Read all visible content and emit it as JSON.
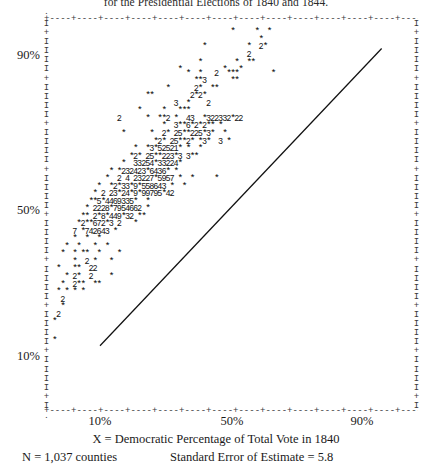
{
  "chart_data": {
    "type": "scatter",
    "title": "for the Presidential Elections of 1840 and 1844.",
    "xlabel": "X = Democratic Percentage of Total Vote in 1840",
    "ylabel": "",
    "xlim": [
      0,
      100
    ],
    "ylim": [
      0,
      100
    ],
    "grid": false,
    "legend": "none",
    "xticks": [
      "10%",
      "50%",
      "90%"
    ],
    "xtick_values": [
      10,
      50,
      90
    ],
    "yticks": [
      "90%",
      "50%",
      "10%"
    ],
    "ytick_values": [
      90,
      50,
      10
    ],
    "point_marker": "*",
    "overplot_notation": "digits 2-9 indicate number of coincident counties",
    "n_label": "N = 1,037 counties",
    "n_value": 1037,
    "se_label": "Standard Error of Estimate = 5.8",
    "se_value": 5.8,
    "regression_line": {
      "x_start": 10,
      "y_start": 13,
      "x_end": 96,
      "y_end": 92
    },
    "rows": [
      {
        "y": 96,
        "cells": "                                             *     *  *"
      },
      {
        "y": 94,
        "cells": "                                                    *"
      },
      {
        "y": 92,
        "cells": "                                      *          *  2*"
      },
      {
        "y": 90,
        "cells": "                                                 2"
      },
      {
        "y": 88,
        "cells": "                                     *        *  **"
      },
      {
        "y": 86,
        "cells": "                                *          *   *"
      },
      {
        "y": 85,
        "cells": "                                  *  *   2  ***        *"
      },
      {
        "y": 83,
        "cells": "                                    **3      **"
      },
      {
        "y": 81,
        "cells": "                             *      2*  **"
      },
      {
        "y": 79,
        "cells": "                        **         2*2*"
      },
      {
        "y": 77,
        "cells": "                               3  *    2"
      },
      {
        "y": 75,
        "cells": "                      *     *   ***"
      },
      {
        "y": 73,
        "cells": "                 2      *  **2 *  43  *322332*22"
      },
      {
        "y": 71,
        "cells": "                            *  3**6*2*2** *"
      },
      {
        "y": 69,
        "cells": "                  *      *  2* 25**225*3*  *"
      },
      {
        "y": 67,
        "cells": "                          *2* 25**2* *3*  3 *"
      },
      {
        "y": 65,
        "cells": "                     *  *3*52521* *  *"
      },
      {
        "y": 63,
        "cells": "                    *2* 25**223*3 3**"
      },
      {
        "y": 61,
        "cells": "                  *  33254*33224*"
      },
      {
        "y": 59,
        "cells": "               * *232423*6436* *"
      },
      {
        "y": 57,
        "cells": "              *  2 4 23227*5957 *  *     *"
      },
      {
        "y": 55,
        "cells": "            *  *2*33*9*558643 *  *"
      },
      {
        "y": 53,
        "cells": "           * 2 23*24*9*99795*42"
      },
      {
        "y": 51,
        "cells": "          **5*4469335*  *"
      },
      {
        "y": 49,
        "cells": "         * 2228*7954662 *"
      },
      {
        "y": 47,
        "cells": "        ** 2*8*449*32 **"
      },
      {
        "y": 45,
        "cells": "       *2**672*3 2   *"
      },
      {
        "y": 43,
        "cells": "      7 *742643 *"
      },
      {
        "y": 41,
        "cells": "      *  *  *"
      },
      {
        "y": 39,
        "cells": "    *  *   *  *"
      },
      {
        "y": 37,
        "cells": "   *  * **  *    *"
      },
      {
        "y": 35,
        "cells": "      *  2 *   *"
      },
      {
        "y": 33,
        "cells": "  *   **  22"
      },
      {
        "y": 31,
        "cells": "    * 2*  2    *"
      },
      {
        "y": 29,
        "cells": "   *  2**  **"
      },
      {
        "y": 27,
        "cells": "  * * * *"
      },
      {
        "y": 25,
        "cells": "   2"
      },
      {
        "y": 23,
        "cells": "   *"
      },
      {
        "y": 21,
        "cells": "  2"
      },
      {
        "y": 19,
        "cells": " *"
      },
      {
        "y": 14,
        "cells": " *"
      }
    ]
  },
  "figure": {
    "title": "for the Presidential Elections of 1840 and 1844.",
    "xlabel": "X = Democratic Percentage of Total Vote in 1840",
    "n_text": "N = 1,037 counties",
    "se_text": "Standard Error of Estimate = 5.8",
    "ytick_labels": [
      "90%",
      "50%",
      "10%"
    ],
    "xtick_labels": [
      "10%",
      "50%",
      "90%"
    ],
    "frame_top": "+----+----+----+----+----+----+----+----+----+----+----+----+----+----+----+----+----+----+-",
    "frame_bottom": "+----+----+----+----+----+----+----+----+----+----+----+----+----+----+----+----+----+----+-",
    "frame_cap_top": ".                                                                                            .",
    "frame_cap_bottom": ".                                                                                            .",
    "frame_vertical_unit": "I",
    "frame_tick_unit": "+",
    "ink_color": "#1a1a1a",
    "paper_color": "#ffffff"
  },
  "points_detail": {
    "scatter_glyphs": [
      {
        "x": 83,
        "y": 96,
        "g": "*"
      },
      {
        "x": 90,
        "y": 96,
        "g": "*"
      },
      {
        "x": 94,
        "y": 96,
        "g": "*"
      },
      {
        "x": 90,
        "y": 94,
        "g": "*"
      },
      {
        "x": 70,
        "y": 92,
        "g": "*"
      },
      {
        "x": 86,
        "y": 92,
        "g": "*"
      },
      {
        "x": 90,
        "y": 92,
        "g": "2"
      },
      {
        "x": 92,
        "y": 92,
        "g": "*"
      },
      {
        "x": 86,
        "y": 90,
        "g": "2"
      },
      {
        "x": 66,
        "y": 88,
        "g": "*"
      },
      {
        "x": 84,
        "y": 88,
        "g": "*"
      },
      {
        "x": 89,
        "y": 88,
        "g": "*"
      },
      {
        "x": 91,
        "y": 88,
        "g": "*"
      },
      {
        "x": 56,
        "y": 86,
        "g": "*"
      },
      {
        "x": 78,
        "y": 86,
        "g": "*"
      },
      {
        "x": 88,
        "y": 86,
        "g": "*"
      },
      {
        "x": 60,
        "y": 85,
        "g": "*"
      },
      {
        "x": 66,
        "y": 85,
        "g": "*"
      },
      {
        "x": 72,
        "y": 85,
        "g": "2"
      },
      {
        "x": 79,
        "y": 85,
        "g": "*"
      },
      {
        "x": 81,
        "y": 85,
        "g": "*"
      },
      {
        "x": 83,
        "y": 85,
        "g": "*"
      },
      {
        "x": 93,
        "y": 85,
        "g": "*"
      },
      {
        "x": 64,
        "y": 83,
        "g": "*"
      },
      {
        "x": 66,
        "y": 83,
        "g": "*"
      },
      {
        "x": 68,
        "y": 83,
        "g": "3"
      },
      {
        "x": 79,
        "y": 83,
        "g": "*"
      },
      {
        "x": 81,
        "y": 83,
        "g": "*"
      },
      {
        "x": 58,
        "y": 81,
        "g": "*"
      },
      {
        "x": 69,
        "y": 81,
        "g": "2"
      },
      {
        "x": 71,
        "y": 81,
        "g": "*"
      },
      {
        "x": 76,
        "y": 81,
        "g": "*"
      },
      {
        "x": 78,
        "y": 81,
        "g": "*"
      },
      {
        "x": 50,
        "y": 79,
        "g": "*"
      },
      {
        "x": 52,
        "y": 79,
        "g": "*"
      },
      {
        "x": 66,
        "y": 79,
        "g": "2"
      },
      {
        "x": 68,
        "y": 79,
        "g": "*"
      },
      {
        "x": 70,
        "y": 79,
        "g": "2"
      },
      {
        "x": 72,
        "y": 79,
        "g": "*"
      },
      {
        "x": 62,
        "y": 77,
        "g": "3"
      },
      {
        "x": 68,
        "y": 77,
        "g": "*"
      },
      {
        "x": 74,
        "y": 77,
        "g": "2"
      },
      {
        "x": 48,
        "y": 75,
        "g": "*"
      },
      {
        "x": 55,
        "y": 75,
        "g": "*"
      },
      {
        "x": 62,
        "y": 75,
        "g": "*"
      },
      {
        "x": 64,
        "y": 75,
        "g": "*"
      },
      {
        "x": 66,
        "y": 75,
        "g": "*"
      }
    ]
  }
}
